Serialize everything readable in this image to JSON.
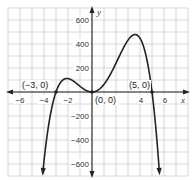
{
  "chart_data": {
    "type": "line",
    "title": "",
    "xlabel": "x",
    "ylabel": "y",
    "xlim": [
      -7,
      8
    ],
    "ylim": [
      -700,
      700
    ],
    "grid": true,
    "x_grid_step": 1,
    "y_grid_step": 100,
    "x_ticks": [
      -6,
      -4,
      -2,
      4,
      6
    ],
    "y_ticks": [
      600,
      400,
      200,
      -200,
      -400,
      -600
    ],
    "series": [
      {
        "name": "f(x) = -4x^2(x+3)(x-5)",
        "description": "Quartic polynomial with x-intercepts at -3, 0 (double root), and 5; both ends point down",
        "x": [
          -3.7,
          -3.5,
          -3,
          -2.5,
          -2,
          -1.5,
          -1,
          -0.5,
          0,
          0.5,
          1,
          1.5,
          2,
          2.5,
          3,
          3.5,
          4,
          4.5,
          5,
          5.5,
          5.7
        ],
        "y": [
          -675,
          -448,
          0,
          83,
          112,
          103,
          72,
          30,
          0,
          16,
          64,
          121,
          240,
          344,
          432,
          468,
          448,
          338,
          0,
          -609,
          -906
        ]
      }
    ],
    "annotations": [
      {
        "text": "(−3, 0)",
        "x": -3,
        "y": 0
      },
      {
        "text": "(0, 0)",
        "x": 0,
        "y": 0
      },
      {
        "text": "(5, 0)",
        "x": 5,
        "y": 0
      }
    ],
    "colors": {
      "curve": "#222222",
      "grid": "#bdbdbd",
      "axis": "#222222"
    }
  },
  "labels": {
    "x_axis": "x",
    "y_axis": "y",
    "x_ticks": [
      "−6",
      "−4",
      "−2",
      "4",
      "6"
    ],
    "y_ticks": [
      "600",
      "400",
      "200",
      "−200",
      "−400",
      "−600"
    ],
    "points": [
      "(−3, 0)",
      "(0, 0)",
      "(5, 0)"
    ]
  }
}
